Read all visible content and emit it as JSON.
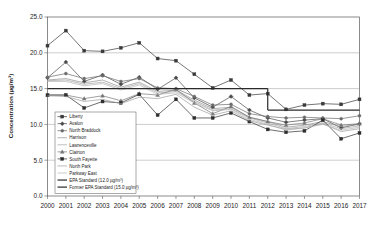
{
  "chart_data": {
    "type": "line",
    "title": "",
    "xlabel": "",
    "ylabel": "Concentration (µg/m³)",
    "ylim": [
      0.0,
      25.0
    ],
    "yticks": [
      "0.0",
      "5.0",
      "10.0",
      "15.0",
      "20.0",
      "25.0"
    ],
    "grid": true,
    "legend_position": "inner-bottom-left",
    "x": [
      2000,
      2001,
      2002,
      2003,
      2004,
      2005,
      2006,
      2007,
      2008,
      2009,
      2010,
      2011,
      2012,
      2013,
      2014,
      2015,
      2016,
      2017
    ],
    "categories": [
      "2000",
      "2001",
      "2002",
      "2003",
      "2004",
      "2005",
      "2006",
      "2007",
      "2008",
      "2009",
      "2010",
      "2011",
      "2012",
      "2013",
      "2014",
      "2015",
      "2016",
      "2017"
    ],
    "series": [
      {
        "name": "Liberty",
        "color": "#3a3a3a",
        "marker": "square",
        "values": [
          21.0,
          23.1,
          20.3,
          20.2,
          20.7,
          21.4,
          19.2,
          18.9,
          17.0,
          15.1,
          16.2,
          14.1,
          14.3,
          12.1,
          12.7,
          12.9,
          12.8,
          13.5
        ]
      },
      {
        "name": "Avalon",
        "color": "#4a4a4a",
        "marker": "diamond",
        "values": [
          16.5,
          18.7,
          16.0,
          16.9,
          15.6,
          16.6,
          14.9,
          16.5,
          13.7,
          12.4,
          13.9,
          12.0,
          10.9,
          10.3,
          10.6,
          10.8,
          9.5,
          10.1
        ]
      },
      {
        "name": "North Braddock",
        "color": "#6b6b6b",
        "marker": "circle",
        "values": [
          16.6,
          17.1,
          16.4,
          16.8,
          16.0,
          16.4,
          15.1,
          15.0,
          13.9,
          12.7,
          12.8,
          11.5,
          11.1,
          10.9,
          11.0,
          10.9,
          10.8,
          11.2
        ]
      },
      {
        "name": "Harrison",
        "color": "#8f8f8f",
        "marker": "none",
        "values": [
          16.2,
          16.4,
          15.8,
          16.2,
          15.2,
          15.9,
          14.6,
          14.8,
          13.4,
          12.2,
          12.4,
          11.0,
          10.4,
          9.6,
          9.9,
          10.4,
          9.7,
          10.0
        ]
      },
      {
        "name": "Lawrenceville",
        "color": "#a5a5a5",
        "marker": "none",
        "values": [
          16.1,
          16.2,
          15.6,
          15.9,
          15.0,
          15.7,
          14.4,
          14.6,
          13.2,
          12.0,
          12.2,
          10.9,
          10.2,
          9.4,
          9.7,
          10.2,
          9.4,
          9.8
        ]
      },
      {
        "name": "Clairton",
        "color": "#777777",
        "marker": "triangle",
        "values": [
          14.1,
          14.1,
          13.6,
          14.0,
          13.3,
          14.3,
          14.1,
          14.9,
          13.0,
          11.5,
          12.5,
          11.0,
          10.4,
          9.9,
          10.2,
          10.8,
          9.9,
          10.1
        ]
      },
      {
        "name": "South Fayette",
        "color": "#2e2e2e",
        "marker": "square",
        "values": [
          14.1,
          14.1,
          12.3,
          13.2,
          13.0,
          14.2,
          11.3,
          13.5,
          10.9,
          10.9,
          11.6,
          10.4,
          9.3,
          8.9,
          9.1,
          10.6,
          8.0,
          8.8
        ]
      },
      {
        "name": "North Park",
        "color": "#9c9c9c",
        "marker": "none",
        "values": [
          14.0,
          13.9,
          13.2,
          13.5,
          12.9,
          13.8,
          13.6,
          14.2,
          12.4,
          11.3,
          11.9,
          10.5,
          9.9,
          9.3,
          9.5,
          10.1,
          9.0,
          9.4
        ]
      },
      {
        "name": "Parkway East",
        "color": "#b5b5b5",
        "marker": "none",
        "values": [
          16.0,
          16.0,
          15.4,
          15.7,
          14.8,
          15.5,
          14.2,
          14.4,
          13.0,
          11.9,
          12.1,
          10.7,
          10.0,
          9.2,
          9.5,
          10.0,
          9.2,
          9.6
        ]
      }
    ],
    "reference_lines": [
      {
        "name": "EPA Standard (12.0 µg/m³)",
        "color": "#2a2a2a",
        "value": 12.0,
        "x_start": 2012,
        "x_end": 2017
      },
      {
        "name": "Former EPA Standard (15.0 µg/m³)",
        "color": "#2a2a2a",
        "value": 15.0,
        "x_start": 2000,
        "x_end": 2012
      }
    ],
    "legend_entries": [
      "Liberty",
      "Avalon",
      "North Braddock",
      "Harrison",
      "Lawrenceville",
      "Clairton",
      "South Fayette",
      "North Park",
      "Parkway East",
      "EPA Standard (12.0 µg/m³)",
      "Former EPA Standard (15.0 µg/m³)"
    ]
  }
}
